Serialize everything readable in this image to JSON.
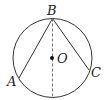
{
  "diagram": {
    "type": "geometry-circle",
    "colors": {
      "stroke": "#333333",
      "dashed": "#777777",
      "background": "#ffffff"
    },
    "circle": {
      "cx": 52.5,
      "cy": 58,
      "r": 39.5
    },
    "points": {
      "B": {
        "label": "B",
        "x": 52.5,
        "y": 18.5
      },
      "A": {
        "label": "A",
        "x": 19,
        "y": 78
      },
      "C": {
        "label": "C",
        "x": 89,
        "y": 70
      },
      "O": {
        "label": "O",
        "x": 52,
        "y": 58
      }
    },
    "segments": [
      {
        "from": "B",
        "to": "A",
        "style": "solid"
      },
      {
        "from": "B",
        "to": "C",
        "style": "solid"
      },
      {
        "from": "B",
        "to": "bottom",
        "style": "dashed",
        "note": "diameter through O"
      }
    ]
  }
}
